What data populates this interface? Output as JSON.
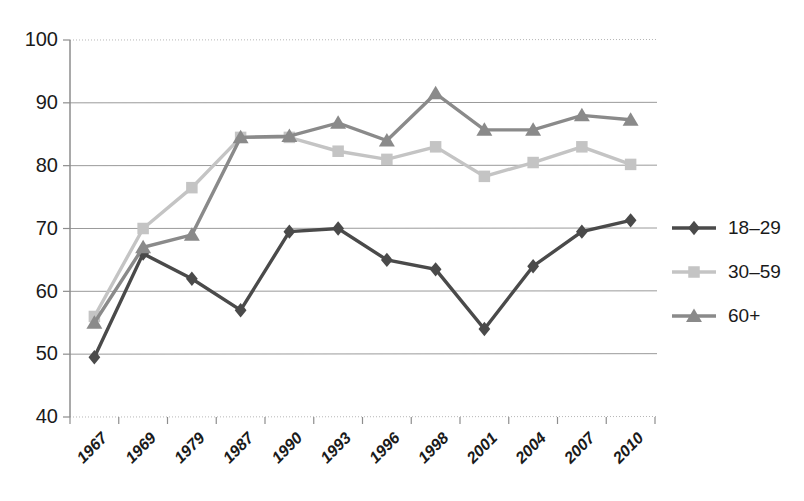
{
  "chart_data": {
    "type": "line",
    "title": "",
    "subtitle": "",
    "xlabel": "",
    "ylabel": "",
    "categories": [
      "1967",
      "1969",
      "1979",
      "1987",
      "1990",
      "1993",
      "1996",
      "1998",
      "2001",
      "2004",
      "2007",
      "2010"
    ],
    "ylim": [
      40,
      100
    ],
    "yticks": [
      40,
      50,
      60,
      70,
      80,
      90,
      100
    ],
    "grid": "horizontal",
    "legend_position": "right",
    "series": [
      {
        "name": "18–29",
        "color": "#4a4a4a",
        "marker": "diamond",
        "values": [
          49.5,
          66.0,
          62.0,
          57.0,
          69.5,
          70.0,
          65.0,
          63.5,
          54.0,
          64.0,
          69.5,
          71.3
        ]
      },
      {
        "name": "30–59",
        "color": "#c4c4c4",
        "marker": "square",
        "values": [
          56.0,
          70.0,
          76.5,
          84.5,
          84.5,
          82.3,
          81.0,
          83.0,
          78.3,
          80.5,
          83.0,
          80.2
        ]
      },
      {
        "name": "60+",
        "color": "#8a8a8a",
        "marker": "triangle",
        "values": [
          55.0,
          67.0,
          69.0,
          84.5,
          84.7,
          86.8,
          84.0,
          91.5,
          85.7,
          85.7,
          88.0,
          87.3
        ]
      }
    ]
  },
  "legend": {
    "items": [
      {
        "label": "18–29"
      },
      {
        "label": "30–59"
      },
      {
        "label": "60+"
      }
    ]
  },
  "axes": {
    "y_tick_labels": [
      "100",
      "90",
      "80",
      "70",
      "60",
      "50",
      "40"
    ],
    "x_tick_labels": [
      "1967",
      "1969",
      "1979",
      "1987",
      "1990",
      "1993",
      "1996",
      "1998",
      "2001",
      "2004",
      "2007",
      "2010"
    ]
  },
  "colors": {
    "series_18_29": "#4a4a4a",
    "series_30_59": "#c4c4c4",
    "series_60_plus": "#8a8a8a",
    "gridline": "#9a9a9a",
    "axis": "#8d8d8d",
    "text": "#1a1a1a",
    "background": "#ffffff"
  }
}
